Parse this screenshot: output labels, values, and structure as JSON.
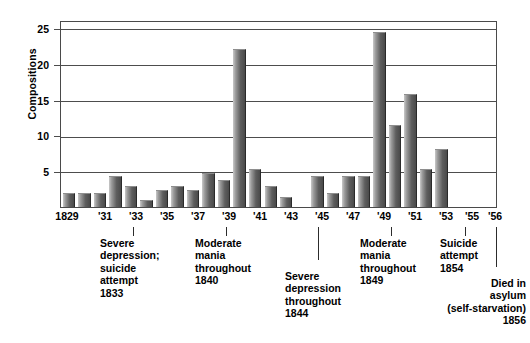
{
  "chart_data": {
    "type": "bar",
    "title": "",
    "xlabel": "",
    "ylabel": "Compositions",
    "ylim": [
      0,
      27
    ],
    "yticks": [
      5,
      10,
      15,
      20,
      25
    ],
    "grid": true,
    "legend": "none",
    "categories": [
      "1829",
      "1830",
      "1831",
      "1832",
      "1833",
      "1834",
      "1835",
      "1836",
      "1837",
      "1838",
      "1839",
      "1840",
      "1841",
      "1842",
      "1843",
      "1844",
      "1845",
      "1846",
      "1847",
      "1848",
      "1849",
      "1850",
      "1851",
      "1852",
      "1853",
      "1854",
      "1855",
      "1856"
    ],
    "values": [
      2,
      2,
      2,
      4.5,
      3,
      1,
      2.5,
      3,
      2.5,
      5,
      4,
      23,
      5.5,
      3,
      1.5,
      0,
      4.5,
      2,
      4.5,
      4.5,
      25.5,
      12,
      16.5,
      5.5,
      8.5,
      0,
      0,
      0
    ],
    "xtick_labels": [
      "1829",
      "'31",
      "'33",
      "'35",
      "'37",
      "'39",
      "'41",
      "'43",
      "'45",
      "'47",
      "'49",
      "'51",
      "'53",
      "'55",
      "'56"
    ],
    "annotations": [
      "Severe\ndepression;\nsuicide\nattempt\n1833",
      "Moderate\nmania\nthroughout\n1840",
      "Severe\ndepression\nthroughout\n1844",
      "Moderate\nmania\nthroughout\n1849",
      "Suicide\nattempt\n1854",
      "Died in\nasylum\n(self-starvation)\n1856"
    ]
  },
  "axis": {
    "y_title": "Compositions",
    "y_tick_0": "25",
    "y_tick_1": "20",
    "y_tick_2": "15",
    "y_tick_3": "10",
    "y_tick_4": "5",
    "x_0": "1829",
    "x_1": "'31",
    "x_2": "'33",
    "x_3": "'35",
    "x_4": "'37",
    "x_5": "'39",
    "x_6": "'41",
    "x_7": "'43",
    "x_8": "'45",
    "x_9": "'47",
    "x_10": "'49",
    "x_11": "'51",
    "x_12": "'53",
    "x_13": "'55",
    "x_14": "'56"
  },
  "annotations": {
    "a1": "Severe\ndepression;\nsuicide\nattempt\n1833",
    "a2": "Moderate\nmania\nthroughout\n1840",
    "a3": "Severe\ndepression\nthroughout\n1844",
    "a4": "Moderate\nmania\nthroughout\n1849",
    "a5": "Suicide\nattempt\n1854",
    "a6": "Died in\nasylum\n(self-starvation)\n1856"
  },
  "colors": {
    "bar_light": "#c9c9c9",
    "bar_dark": "#4a4a4a",
    "axis": "#4a4a4a",
    "text": "#000000",
    "background": "#ffffff"
  }
}
